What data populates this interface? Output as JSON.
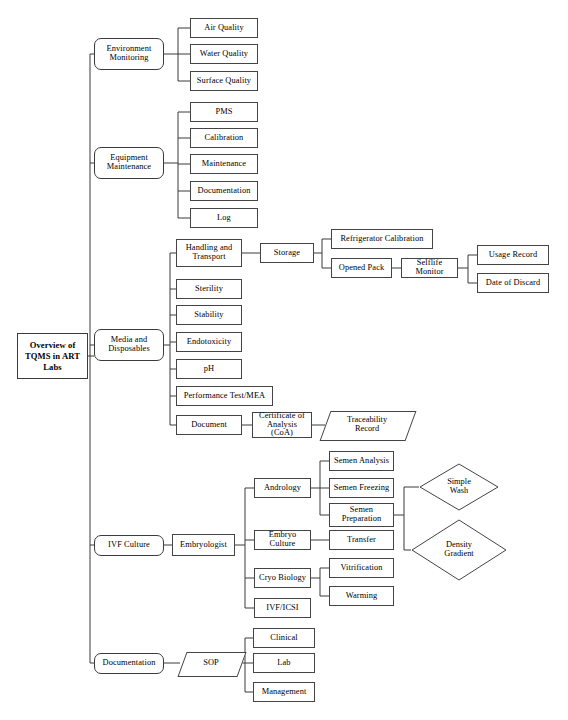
{
  "diagram": {
    "title": "Overview of TQMS in ART Labs",
    "type": "organizational-flowchart",
    "root": {
      "label": "Overview of\nTQMS in\nART Labs",
      "shape": "rectangle",
      "bold": true
    }
  },
  "nodes": {
    "root": "Overview of TQMS in ART Labs",
    "environment_monitoring": "Environment\nMonitoring",
    "air_quality": "Air Quality",
    "water_quality": "Water Quality",
    "surface_quality": "Surface Quality",
    "equipment_maintenance": "Equipment\nMaintenance",
    "pms": "PMS",
    "calibration": "Calibration",
    "maintenance": "Maintenance",
    "documentation_equip": "Documentation",
    "log": "Log",
    "media_and_disposables": "Media and\nDisposables",
    "handling_and_transport": "Handling and\nTransport",
    "storage": "Storage",
    "refrigerator_calibration": "Refrigerator Calibration",
    "opened_pack": "Opened Pack",
    "selflife_monitor": "Selflife Monitor",
    "usage_record": "Usage Record",
    "date_of_discard": "Date of Discard",
    "sterility": "Sterility",
    "stability": "Stability",
    "endotoxicity": "Endotoxicity",
    "ph": "pH",
    "performance_test_mea": "Performance Test/MEA",
    "document": "Document",
    "certificate_of_analysis": "Certificate of\nAnalysis (CoA)",
    "traceability_record": "Traceability\nRecord",
    "ivf_culture": "IVF Culture",
    "embryologist": "Embryologist",
    "andrology": "Andrology",
    "semen_analysis": "Semen Analysis",
    "semen_freezing": "Semen Freezing",
    "semen_preparation": "Semen\nPreparation",
    "simple_wash": "Simple\nWash",
    "density_gradient": "Density\nGradient",
    "embryo_culture": "Embryo Culture",
    "transfer": "Transfer",
    "cryo_biology": "Cryo Biology",
    "vitrification": "Vitrification",
    "warming": "Warming",
    "ivf_icsi": "IVF/ICSI",
    "documentation": "Documentation",
    "sop": "SOP",
    "clinical": "Clinical",
    "lab": "Lab",
    "management": "Management"
  },
  "colors": {
    "stroke": "#444444",
    "background": "#ffffff",
    "text": "#000000"
  }
}
